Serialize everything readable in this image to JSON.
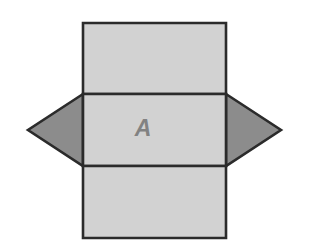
{
  "figure": {
    "background_color": "#ffffff",
    "stroke_color": "#2b2b2b",
    "stroke_width": 2.6,
    "rect_fill": "#d2d2d2",
    "triangle_fill": "#8c8c8c",
    "label_color": "#828282",
    "faces": [
      {
        "name": "top-rectangle",
        "shape": "rectangle",
        "label": "",
        "fill": "#d2d2d2",
        "points": "83,23 226,23 226,94 83,94"
      },
      {
        "name": "middle-rectangle",
        "shape": "rectangle",
        "label": "A",
        "fill": "#d2d2d2",
        "points": "83,94 226,94 226,166 83,166"
      },
      {
        "name": "bottom-rectangle",
        "shape": "rectangle",
        "label": "",
        "fill": "#d2d2d2",
        "points": "83,166 226,166 226,238 83,238"
      },
      {
        "name": "left-triangle",
        "shape": "triangle",
        "label": "",
        "fill": "#8c8c8c",
        "points": "83,94 28,130 83,166"
      },
      {
        "name": "right-triangle",
        "shape": "triangle",
        "label": "",
        "fill": "#8c8c8c",
        "points": "226,94 281,130 226,166"
      }
    ],
    "labels": [
      {
        "name": "face-label-a",
        "text": "A",
        "x": 143,
        "y": 130
      }
    ]
  }
}
